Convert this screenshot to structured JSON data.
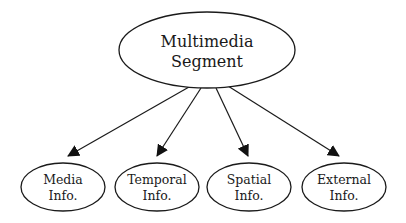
{
  "diagram": {
    "type": "tree",
    "root": {
      "id": "multimedia-segment",
      "lines": [
        "Multimedia",
        "Segment"
      ],
      "cx": 207,
      "cy": 50,
      "rx": 88,
      "ry": 38
    },
    "children": [
      {
        "id": "media-info",
        "lines": [
          "Media",
          "Info."
        ],
        "cx": 63,
        "cy": 187,
        "rx": 42,
        "ry": 24,
        "edge": {
          "x1": 189,
          "y1": 87,
          "x2": 68,
          "y2": 156
        }
      },
      {
        "id": "temporal-info",
        "lines": [
          "Temporal",
          "Info."
        ],
        "cx": 157,
        "cy": 187,
        "rx": 42,
        "ry": 24,
        "edge": {
          "x1": 201,
          "y1": 88,
          "x2": 157,
          "y2": 156
        }
      },
      {
        "id": "spatial-info",
        "lines": [
          "Spatial",
          "Info."
        ],
        "cx": 249,
        "cy": 187,
        "rx": 42,
        "ry": 24,
        "edge": {
          "x1": 216,
          "y1": 88,
          "x2": 248,
          "y2": 156
        }
      },
      {
        "id": "external-info",
        "lines": [
          "External",
          "Info."
        ],
        "cx": 344,
        "cy": 187,
        "rx": 42,
        "ry": 24,
        "edge": {
          "x1": 228,
          "y1": 86,
          "x2": 339,
          "y2": 156
        }
      }
    ],
    "colors": {
      "stroke": "#1a1a1a",
      "fill": "#ffffff",
      "arrow": "#111111",
      "background": "#ffffff"
    }
  }
}
